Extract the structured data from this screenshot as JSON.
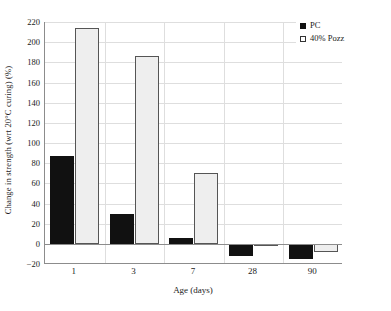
{
  "chart_data": {
    "type": "bar",
    "title": "",
    "subtitle": "",
    "xlabel": "Age (days)",
    "ylabel": "Change in strength (wrt 20°C curing) (%)",
    "categories": [
      "1",
      "3",
      "7",
      "28",
      "90"
    ],
    "series": [
      {
        "name": "PC",
        "values": [
          87,
          30,
          6,
          -12,
          -15
        ],
        "color": "#111111"
      },
      {
        "name": "40% Pozz",
        "values": [
          214,
          186,
          70,
          -1,
          -8
        ],
        "color": "#eeeeee"
      }
    ],
    "ylim": [
      -20,
      220
    ],
    "yticks": [
      220,
      200,
      180,
      160,
      140,
      120,
      100,
      80,
      60,
      40,
      20,
      0,
      -20
    ],
    "ytick_labels": [
      "220",
      "200",
      "180",
      "160",
      "140",
      "120",
      "100",
      "80",
      "60",
      "40",
      "20",
      "0",
      "−20"
    ],
    "grid": true,
    "grid_axis": "both",
    "legend": {
      "position": "top-right",
      "entries": [
        {
          "label": "PC",
          "swatch": "filled-square-icon"
        },
        {
          "label": "40% Pozz",
          "swatch": "open-square-icon"
        }
      ]
    }
  }
}
